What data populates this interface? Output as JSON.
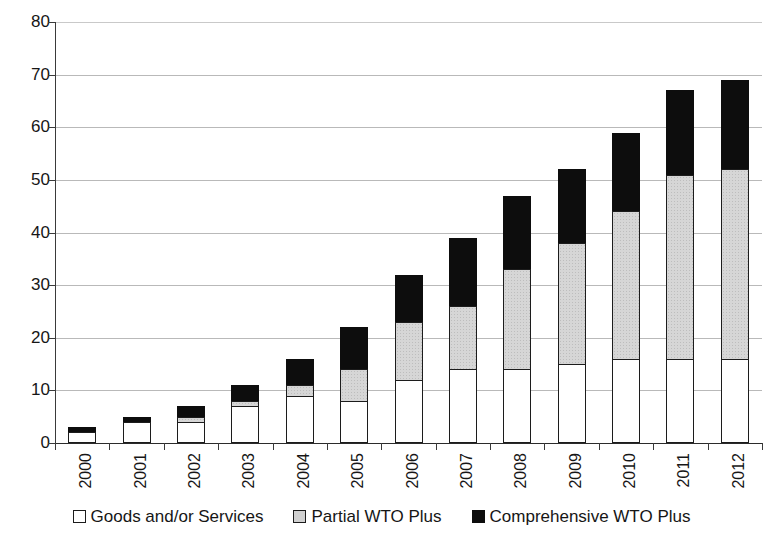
{
  "chart_data": {
    "type": "bar",
    "subtype": "stacked-vertical",
    "title": "",
    "subtitle": "",
    "xlabel": "",
    "ylabel": "",
    "ylim": [
      0,
      80
    ],
    "yticks": [
      0,
      10,
      20,
      30,
      40,
      50,
      60,
      70,
      80
    ],
    "ytick_labels": [
      "0",
      "10",
      "20",
      "30",
      "40",
      "50",
      "60",
      "70",
      "80"
    ],
    "grid": true,
    "grid_axis": "y",
    "legend_position": "bottom-center",
    "categories": [
      "2000",
      "2001",
      "2002",
      "2003",
      "2004",
      "2005",
      "2006",
      "2007",
      "2008",
      "2009",
      "2010",
      "2011",
      "2012"
    ],
    "series": [
      {
        "name": "Goods and/or Services",
        "color": "#ffffff",
        "values": [
          2,
          4,
          4,
          7,
          9,
          8,
          12,
          14,
          14,
          15,
          16,
          16,
          16
        ]
      },
      {
        "name": "Partial WTO Plus",
        "color": "#d0d0d0",
        "values": [
          0,
          0,
          1,
          1,
          2,
          6,
          11,
          12,
          19,
          23,
          28,
          35,
          36
        ]
      },
      {
        "name": "Comprehensive WTO Plus",
        "color": "#0d0d0d",
        "values": [
          1,
          1,
          2,
          3,
          5,
          8,
          9,
          13,
          14,
          14,
          15,
          16,
          17
        ]
      }
    ],
    "totals": [
      3,
      5,
      7,
      11,
      16,
      22,
      32,
      39,
      47,
      52,
      59,
      67,
      69
    ]
  },
  "legend": {
    "items": [
      {
        "label": "Goods and/or Services",
        "swatch": "white-square"
      },
      {
        "label": "Partial WTO Plus",
        "swatch": "gray-square"
      },
      {
        "label": "Comprehensive WTO Plus",
        "swatch": "black-square"
      }
    ]
  }
}
